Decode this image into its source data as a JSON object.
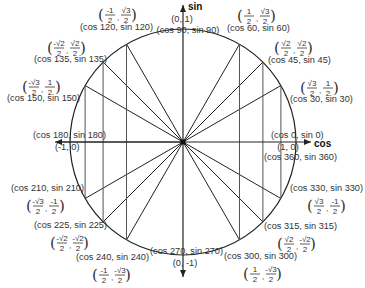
{
  "diagram": {
    "type": "unit-circle",
    "center": [
      183,
      142
    ],
    "radius": 113,
    "colors": {
      "line": "#222222",
      "text": "#333333",
      "background": "#ffffff"
    },
    "axes": {
      "horizontal_label": "cos",
      "vertical_label": "sin",
      "x_extent": [
        55,
        311
      ],
      "y_extent": [
        5,
        277
      ]
    },
    "points": [
      {
        "angle": 0,
        "label": "(cos 0, sin 0)",
        "coord_text": "(1, 0)",
        "cos": "1",
        "sin": "0"
      },
      {
        "angle": 30,
        "label": "(cos 30, sin 30)",
        "cos": "√3/2",
        "sin": "1/2"
      },
      {
        "angle": 45,
        "label": "(cos 45, sin 45)",
        "cos": "√2/2",
        "sin": "√2/2"
      },
      {
        "angle": 60,
        "label": "(cos 60, sin 60)",
        "cos": "1/2",
        "sin": "√3/2"
      },
      {
        "angle": 90,
        "label": "(cos 90, sin 90)",
        "coord_text": "(0, 1)",
        "cos": "0",
        "sin": "1"
      },
      {
        "angle": 120,
        "label": "(cos 120, sin 120)",
        "cos": "-1/2",
        "sin": "√3/2"
      },
      {
        "angle": 135,
        "label": "(cos 135, sin 135)",
        "cos": "-√2/2",
        "sin": "√2/2"
      },
      {
        "angle": 150,
        "label": "(cos 150, sin 150)",
        "cos": "-√3/2",
        "sin": "1/2"
      },
      {
        "angle": 180,
        "label": "(cos 180, sin 180)",
        "coord_text": "(-1, 0)",
        "cos": "-1",
        "sin": "0"
      },
      {
        "angle": 210,
        "label": "(cos 210, sin 210)",
        "cos": "-√3/2",
        "sin": "-1/2"
      },
      {
        "angle": 225,
        "label": "(cos 225, sin 225)",
        "cos": "-√2/2",
        "sin": "-√2/2"
      },
      {
        "angle": 240,
        "label": "(cos 240, sin 240)",
        "cos": "-1/2",
        "sin": "-√3/2"
      },
      {
        "angle": 270,
        "label": "(cos 270, sin 270)",
        "coord_text": "(0, -1)",
        "cos": "0",
        "sin": "-1"
      },
      {
        "angle": 300,
        "label": "(cos 300, sin 300)",
        "cos": "1/2",
        "sin": "-√3/2"
      },
      {
        "angle": 315,
        "label": "(cos 315, sin 315)",
        "cos": "√2/2",
        "sin": "-√2/2"
      },
      {
        "angle": 330,
        "label": "(cos 330, sin 330)",
        "cos": "√3/2",
        "sin": "-1/2"
      },
      {
        "angle": 360,
        "label": "(cos 360, sin 360)"
      }
    ],
    "fractions": {
      "f60": {
        "a_num": "1",
        "a_den": "2",
        "b_num": "√3",
        "b_den": "2"
      },
      "f45": {
        "a_num": "√2",
        "a_den": "2",
        "b_num": "√2",
        "b_den": "2"
      },
      "f30": {
        "a_num": "√3",
        "a_den": "2",
        "b_num": "1",
        "b_den": "2"
      },
      "f120": {
        "a_num": "-1",
        "a_den": "2",
        "b_num": "√3",
        "b_den": "2"
      },
      "f135": {
        "a_num": "-√2",
        "a_den": "2",
        "b_num": "√2",
        "b_den": "2"
      },
      "f150": {
        "a_num": "-√3",
        "a_den": "2",
        "b_num": "1",
        "b_den": "2"
      },
      "f210": {
        "a_num": "-√3",
        "a_den": "2",
        "b_num": "-1",
        "b_den": "2"
      },
      "f225": {
        "a_num": "-√2",
        "a_den": "2",
        "b_num": "-√2",
        "b_den": "2"
      },
      "f240": {
        "a_num": "-1",
        "a_den": "2",
        "b_num": "-√3",
        "b_den": "2"
      },
      "f300": {
        "a_num": "1",
        "a_den": "2",
        "b_num": "-√3",
        "b_den": "2"
      },
      "f315": {
        "a_num": "√2",
        "a_den": "2",
        "b_num": "-√2",
        "b_den": "2"
      },
      "f330": {
        "a_num": "√3",
        "a_den": "2",
        "b_num": "-1",
        "b_den": "2"
      }
    }
  }
}
